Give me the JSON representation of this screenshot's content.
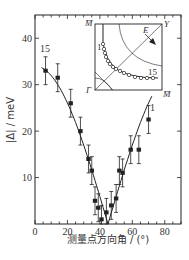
{
  "chart_data": {
    "type": "scatter",
    "title": "",
    "xlabel": "测量点方向角 / (°)",
    "ylabel": "|Δ| / meV",
    "xlim": [
      0,
      90
    ],
    "ylim": [
      0,
      45
    ],
    "xticks": [
      0,
      20,
      40,
      60,
      80
    ],
    "yticks": [
      10,
      20,
      30,
      40
    ],
    "grid": false,
    "series": [
      {
        "name": "gap magnitude",
        "marker": "filled-circle",
        "error_bars": true,
        "x": [
          6.5,
          14,
          22,
          28,
          33,
          35,
          37,
          39,
          41,
          44,
          47,
          50,
          52,
          54,
          59,
          64,
          70
        ],
        "y": [
          33,
          31.5,
          26,
          20,
          14,
          11.5,
          5,
          3.5,
          1,
          2.5,
          4,
          5.5,
          11.5,
          11,
          16,
          16,
          22.5
        ],
        "yerr": [
          3,
          3,
          3,
          3,
          3,
          3,
          3,
          3,
          3,
          3,
          3,
          3,
          3,
          3,
          3,
          3,
          3
        ]
      }
    ],
    "fit_curve": {
      "type": "line",
      "description": "|cos 2θ| d-wave fit",
      "color": "#222222"
    },
    "annotations": [
      {
        "text": "15",
        "x": 6,
        "y": 37
      },
      {
        "text": "1",
        "x": 74,
        "y": 25
      }
    ],
    "inset": {
      "description": "Brillouin zone quadrant with Fermi surface measurement points",
      "corner_labels": {
        "top_left": "M̄",
        "bottom_left": "Γ",
        "top_right": "Y",
        "bottom_right": "M̄"
      },
      "arrow_label": "E",
      "point_labels": {
        "start": "1",
        "end": "15"
      },
      "num_points": 15
    }
  },
  "colors": {
    "ink": "#222222",
    "background": "#ffffff"
  }
}
